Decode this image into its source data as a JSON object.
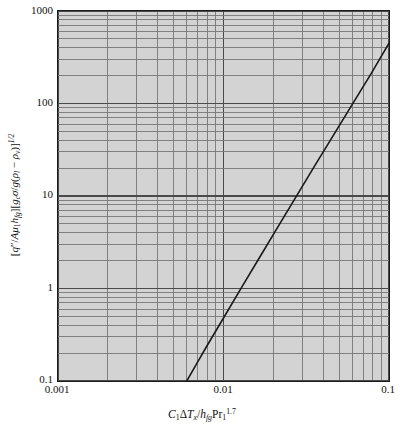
{
  "chart_data": {
    "type": "line",
    "title": "",
    "xlabel": "C_1 ΔT_x / h_fg Pr_1^1.7",
    "ylabel": "[q''/A μ_1 h_fg][g_c σ / g(ρ_l - ρ_v)]^1/2",
    "xscale": "log",
    "yscale": "log",
    "xlim": [
      0.001,
      0.1
    ],
    "ylim": [
      0.1,
      1000
    ],
    "grid": true,
    "grid_minor": true,
    "legend": "none",
    "xtick_labels": [
      "0.001",
      "0.01",
      "0.1"
    ],
    "xtick_values": [
      0.001,
      0.01,
      0.1
    ],
    "ytick_labels": [
      "0.1",
      "1",
      "10",
      "100",
      "1000"
    ],
    "ytick_values": [
      0.1,
      1,
      10,
      100,
      1000
    ],
    "series": [
      {
        "name": "Rohsenow correlation",
        "color": "#1a1a1a",
        "linewidth": 1.6,
        "x": [
          0.006,
          0.007,
          0.008,
          0.01,
          0.013,
          0.017,
          0.022,
          0.028,
          0.036,
          0.046,
          0.06,
          0.078,
          0.1
        ],
        "y": [
          0.1,
          0.162,
          0.245,
          0.48,
          1.06,
          2.36,
          5.1,
          10.4,
          22.0,
          45.0,
          98.0,
          210.0,
          450.0
        ]
      }
    ]
  },
  "axes": {
    "y_ticks": [
      {
        "label": "1000",
        "value": 1000
      },
      {
        "label": "100",
        "value": 100
      },
      {
        "label": "10",
        "value": 10
      },
      {
        "label": "1",
        "value": 1
      },
      {
        "label": "0.1",
        "value": 0.1
      }
    ],
    "x_ticks": [
      {
        "label": "0.001",
        "value": 0.001
      },
      {
        "label": "0.01",
        "value": 0.01
      },
      {
        "label": "0.1",
        "value": 0.1
      }
    ]
  },
  "style": {
    "plot_background": "#d3d3d3",
    "frame_color": "#1a1a1a",
    "major_grid_color": "#4a4a4a",
    "minor_grid_color": "#777777",
    "curve_color": "#1a1a1a",
    "page_background": "#ffffff",
    "text_color": "#111111"
  }
}
